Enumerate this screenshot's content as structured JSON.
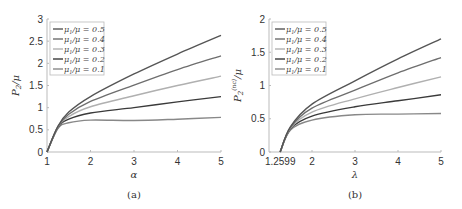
{
  "chart_data": [
    {
      "type": "line",
      "panel": "(a)",
      "title": "",
      "xlabel": "α",
      "ylabel": "P_2/μ",
      "xlim": [
        1,
        5
      ],
      "ylim": [
        0,
        3
      ],
      "xticks": [
        "1",
        "2",
        "3",
        "4",
        "5"
      ],
      "yticks": [
        "0",
        "0.5",
        "1",
        "1.5",
        "2",
        "2.5",
        "3"
      ],
      "grid": false,
      "legend_position": "upper left",
      "x": [
        1.0,
        1.25,
        1.5,
        2.0,
        3.0,
        4.0,
        5.0
      ],
      "series": [
        {
          "name": "μ1/μ = 0.5",
          "color": "#555555",
          "values": [
            0,
            0.58,
            0.9,
            1.25,
            1.76,
            2.21,
            2.63
          ]
        },
        {
          "name": "μ1/μ = 0.4",
          "color": "#6e6e6e",
          "values": [
            0,
            0.57,
            0.85,
            1.14,
            1.51,
            1.86,
            2.17
          ]
        },
        {
          "name": "μ1/μ = 0.3",
          "color": "#b0b0b0",
          "values": [
            0,
            0.56,
            0.8,
            1.02,
            1.27,
            1.5,
            1.71
          ]
        },
        {
          "name": "μ1/μ = 0.2",
          "color": "#3a3a3a",
          "values": [
            0,
            0.55,
            0.74,
            0.88,
            1.0,
            1.13,
            1.25
          ]
        },
        {
          "name": "μ1/μ = 0.1",
          "color": "#888888",
          "values": [
            0,
            0.53,
            0.66,
            0.72,
            0.71,
            0.74,
            0.78
          ]
        }
      ],
      "caption": "(a)"
    },
    {
      "type": "line",
      "panel": "(b)",
      "title": "",
      "xlabel": "λ",
      "ylabel": "P_2^(nc)/μ",
      "xlim": [
        1,
        5
      ],
      "ylim": [
        0,
        2
      ],
      "xticks": [
        "1.2599",
        "2",
        "3",
        "4",
        "5"
      ],
      "yticks": [
        "0",
        "0.5",
        "1",
        "1.5",
        "2"
      ],
      "grid": false,
      "legend_position": "upper left",
      "x": [
        1.2599,
        1.5,
        2.0,
        3.0,
        4.0,
        5.0
      ],
      "series": [
        {
          "name": "μ1/μ = 0.5",
          "color": "#555555",
          "values": [
            0,
            0.38,
            0.72,
            1.07,
            1.4,
            1.7
          ]
        },
        {
          "name": "μ1/μ = 0.4",
          "color": "#6e6e6e",
          "values": [
            0,
            0.37,
            0.66,
            0.93,
            1.19,
            1.42
          ]
        },
        {
          "name": "μ1/μ = 0.3",
          "color": "#b0b0b0",
          "values": [
            0,
            0.36,
            0.6,
            0.8,
            0.97,
            1.13
          ]
        },
        {
          "name": "μ1/μ = 0.2",
          "color": "#3a3a3a",
          "values": [
            0,
            0.35,
            0.54,
            0.68,
            0.77,
            0.86
          ]
        },
        {
          "name": "μ1/μ = 0.1",
          "color": "#888888",
          "values": [
            0,
            0.33,
            0.48,
            0.56,
            0.57,
            0.58
          ]
        }
      ],
      "caption": "(b)"
    }
  ]
}
